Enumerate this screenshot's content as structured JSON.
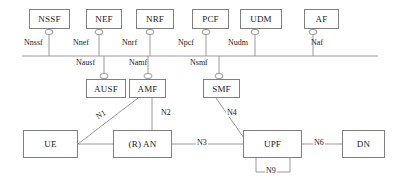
{
  "diagram": {
    "type": "network-architecture-diagram",
    "line_color": "#808080",
    "text_color": "#1a1a1a",
    "background": "#ffffff",
    "top_nodes": [
      {
        "id": "nssf",
        "label": "NSSF",
        "x": 29,
        "y": 9,
        "w": 41,
        "h": 20
      },
      {
        "id": "nef",
        "label": "NEF",
        "x": 86,
        "y": 9,
        "w": 36,
        "h": 20
      },
      {
        "id": "nrf",
        "label": "NRF",
        "x": 136,
        "y": 9,
        "w": 38,
        "h": 20
      },
      {
        "id": "pcf",
        "label": "PCF",
        "x": 192,
        "y": 9,
        "w": 37,
        "h": 20
      },
      {
        "id": "udm",
        "label": "UDM",
        "x": 240,
        "y": 9,
        "w": 42,
        "h": 20
      },
      {
        "id": "af",
        "label": "AF",
        "x": 304,
        "y": 9,
        "w": 35,
        "h": 20
      }
    ],
    "mid_nodes": [
      {
        "id": "ausf",
        "label": "AUSF",
        "x": 86,
        "y": 79,
        "w": 40,
        "h": 19
      },
      {
        "id": "amf",
        "label": "AMF",
        "x": 129,
        "y": 79,
        "w": 37,
        "h": 19
      },
      {
        "id": "smf",
        "label": "SMF",
        "x": 203,
        "y": 79,
        "w": 37,
        "h": 19
      }
    ],
    "bottom_nodes": [
      {
        "id": "ue",
        "label": "UE",
        "x": 23,
        "y": 130,
        "w": 55,
        "h": 28
      },
      {
        "id": "ran",
        "label": "(R) AN",
        "x": 113,
        "y": 130,
        "w": 59,
        "h": 28
      },
      {
        "id": "upf",
        "label": "UPF",
        "x": 243,
        "y": 130,
        "w": 59,
        "h": 28
      },
      {
        "id": "dn",
        "label": "DN",
        "x": 342,
        "y": 130,
        "w": 43,
        "h": 28
      }
    ],
    "service_bus": {
      "x1": 22,
      "x2": 378,
      "y": 56
    },
    "sbi_labels": [
      {
        "id": "nnssf",
        "label": "Nnssf",
        "x": 24,
        "y": 38
      },
      {
        "id": "nnef",
        "label": "Nnef",
        "x": 73,
        "y": 38
      },
      {
        "id": "nnrf",
        "label": "Nnrf",
        "x": 122,
        "y": 38
      },
      {
        "id": "npcf",
        "label": "Npcf",
        "x": 178,
        "y": 38
      },
      {
        "id": "nudm",
        "label": "Nudm",
        "x": 228,
        "y": 38
      },
      {
        "id": "naf",
        "label": "Naf",
        "x": 311,
        "y": 38
      },
      {
        "id": "nausf",
        "label": "Nausf",
        "x": 76,
        "y": 58
      },
      {
        "id": "namf",
        "label": "Namf",
        "x": 129,
        "y": 58
      },
      {
        "id": "nsmf",
        "label": "Nsmf",
        "x": 190,
        "y": 58
      }
    ],
    "reference_point_labels": [
      {
        "id": "n1",
        "label": "N1",
        "x": 95,
        "y": 110,
        "rotated": true
      },
      {
        "id": "n2",
        "label": "N2",
        "x": 160,
        "y": 108,
        "rotated": false
      },
      {
        "id": "n3",
        "label": "N3",
        "x": 196,
        "y": 138,
        "rotated": false
      },
      {
        "id": "n4",
        "label": "N4",
        "x": 226,
        "y": 108,
        "rotated": false
      },
      {
        "id": "n6",
        "label": "N6",
        "x": 313,
        "y": 138,
        "rotated": false
      },
      {
        "id": "n9",
        "label": "N9",
        "x": 265,
        "y": 170,
        "rotated": false
      }
    ],
    "sbi_connectors": [
      {
        "id": "connector-nssf",
        "cx": 49,
        "cy": 32
      },
      {
        "id": "connector-nef",
        "cx": 99,
        "cy": 32
      },
      {
        "id": "connector-nrf",
        "cx": 150,
        "cy": 32
      },
      {
        "id": "connector-pcf",
        "cx": 206,
        "cy": 32
      },
      {
        "id": "connector-udm",
        "cx": 255,
        "cy": 32
      },
      {
        "id": "connector-af",
        "cx": 313,
        "cy": 32
      },
      {
        "id": "connector-ausf",
        "cx": 104,
        "cy": 76
      },
      {
        "id": "connector-amf",
        "cx": 148,
        "cy": 76
      },
      {
        "id": "connector-smf",
        "cx": 219,
        "cy": 76
      }
    ]
  }
}
